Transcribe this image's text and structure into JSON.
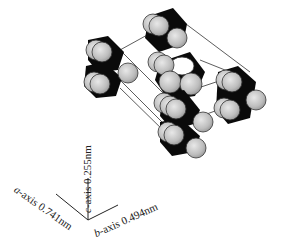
{
  "figure": {
    "type": "crystal-unit-cell-diagram",
    "colors": {
      "sphere_fill": "#c4c4c4",
      "sphere_stroke": "#333333",
      "bond_fill": "#0a0a0a",
      "cell_line": "#333333",
      "background": "#ffffff"
    }
  },
  "axes": {
    "a": {
      "letter": "a",
      "text": "-axis 0.741nm"
    },
    "b": {
      "letter": "b",
      "text": "-axis 0.494nm"
    },
    "c": {
      "letter": "c",
      "text": "-axis 0.255nm"
    }
  }
}
